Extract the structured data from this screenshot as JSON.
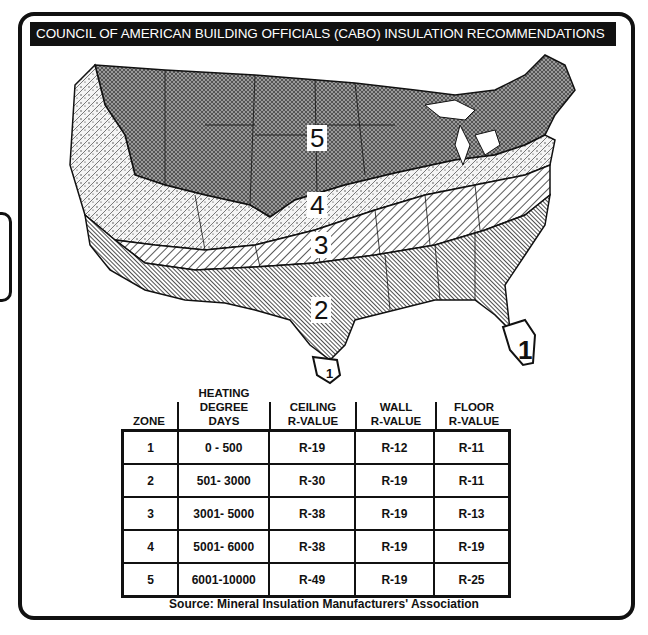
{
  "title": "COUNCIL OF AMERICAN BUILDING OFFICIALS (CABO) INSULATION RECOMMENDATIONS",
  "map": {
    "zone_labels": [
      {
        "zone": "5",
        "x": 252,
        "y": 80
      },
      {
        "zone": "4",
        "x": 252,
        "y": 147
      },
      {
        "zone": "3",
        "x": 256,
        "y": 187
      },
      {
        "zone": "2",
        "x": 256,
        "y": 252
      },
      {
        "zone": "1",
        "x": 466,
        "y": 294
      },
      {
        "zone": "1",
        "x": 267,
        "y": 321
      }
    ],
    "colors": {
      "zone5": "#8a8a8a",
      "zone4": "#f0f0f0",
      "zone3": "#ffffff",
      "zone2": "#7a7a7a",
      "zone1": "#ffffff",
      "lines": "#111111"
    }
  },
  "table": {
    "headers": [
      {
        "line1": "",
        "line2": "",
        "line3": "ZONE"
      },
      {
        "line1": "HEATING",
        "line2": "DEGREE",
        "line3": "DAYS"
      },
      {
        "line1": "",
        "line2": "CEILING",
        "line3": "R-VALUE"
      },
      {
        "line1": "",
        "line2": "WALL",
        "line3": "R-VALUE"
      },
      {
        "line1": "",
        "line2": "FLOOR",
        "line3": "R-VALUE"
      }
    ],
    "rows": [
      [
        "1",
        "0 - 500",
        "R-19",
        "R-12",
        "R-11"
      ],
      [
        "2",
        "501- 3000",
        "R-30",
        "R-19",
        "R-11"
      ],
      [
        "3",
        "3001- 5000",
        "R-38",
        "R-19",
        "R-13"
      ],
      [
        "4",
        "5001- 6000",
        "R-38",
        "R-19",
        "R-19"
      ],
      [
        "5",
        "6001-10000",
        "R-49",
        "R-19",
        "R-25"
      ]
    ]
  },
  "source": "Source:  Mineral Insulation Manufacturers' Association"
}
